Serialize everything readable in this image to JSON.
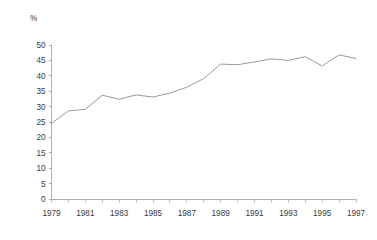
{
  "chart_data": {
    "type": "line",
    "title": "",
    "subtitle": "",
    "xlabel": "",
    "ylabel": "%",
    "unit_label": "%",
    "grid": false,
    "legend": false,
    "legend_position": "none",
    "line_color": "#8d8d8d",
    "axis_color": "#9a9a9a",
    "text_color": "#3a3a3a",
    "background_color": "#ffffff",
    "xlim": [
      1979,
      1997
    ],
    "ylim": [
      0,
      50
    ],
    "y_ticks": [
      0,
      5,
      10,
      15,
      20,
      25,
      30,
      35,
      40,
      45,
      50
    ],
    "y_tick_labels": [
      "0",
      "5",
      "10",
      "15",
      "20",
      "25",
      "30",
      "35",
      "40",
      "45",
      "50"
    ],
    "x_ticks": [
      1979,
      1980,
      1981,
      1982,
      1983,
      1984,
      1985,
      1986,
      1987,
      1988,
      1989,
      1990,
      1991,
      1992,
      1993,
      1994,
      1995,
      1996,
      1997
    ],
    "x_tick_labels_shown": [
      "1979",
      "1981",
      "1983",
      "1985",
      "1987",
      "1989",
      "1991",
      "1993",
      "1995",
      "1997"
    ],
    "x_tick_label_interval": 2,
    "x": [
      1979,
      1980,
      1981,
      1982,
      1983,
      1984,
      1985,
      1986,
      1987,
      1988,
      1989,
      1990,
      1991,
      1992,
      1993,
      1994,
      1995,
      1996,
      1997
    ],
    "values": [
      24.5,
      28.6,
      29.1,
      33.7,
      32.4,
      33.8,
      33.1,
      34.4,
      36.3,
      39.1,
      43.8,
      43.6,
      44.5,
      45.5,
      45.0,
      46.2,
      43.2,
      46.8,
      45.6
    ],
    "series": [
      {
        "name": "",
        "values": [
          24.5,
          28.6,
          29.1,
          33.7,
          32.4,
          33.8,
          33.1,
          34.4,
          36.3,
          39.1,
          43.8,
          43.6,
          44.5,
          45.5,
          45.0,
          46.2,
          43.2,
          46.8,
          45.6
        ]
      }
    ]
  }
}
